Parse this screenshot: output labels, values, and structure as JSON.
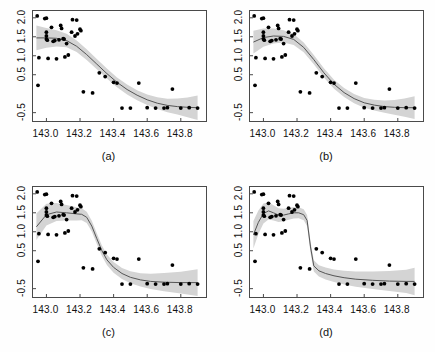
{
  "figure": {
    "type": "multi-panel-scatter-smoother",
    "panel_count": 4,
    "layout": "2x2"
  },
  "chart_data": [
    {
      "type": "scatter",
      "panel_label": "(a)",
      "title": "",
      "xlabel": "",
      "ylabel": "",
      "xlim": [
        142.92,
        143.95
      ],
      "ylim": [
        -0.72,
        2.18
      ],
      "xticks": [
        143.0,
        143.2,
        143.4,
        143.6,
        143.8
      ],
      "xticklabels": [
        "143.0",
        "143.2",
        "143.4",
        "143.6",
        "143.8"
      ],
      "yticks": [
        -0.5,
        0.5,
        1.0,
        1.5,
        2.0
      ],
      "yticklabels": [
        "-0.5",
        "0.5",
        "1.0",
        "1.5",
        "2.0"
      ],
      "grid": false,
      "legend": null,
      "point_color": "#000000",
      "line_color": "#555555",
      "band_color": "#d4d4d4",
      "smoother": "loess/spline fit with confidence band",
      "points": [
        [
          142.945,
          2.05
        ],
        [
          142.95,
          0.22
        ],
        [
          142.955,
          0.95
        ],
        [
          142.99,
          1.98
        ],
        [
          143.0,
          1.99
        ],
        [
          143.0,
          1.62
        ],
        [
          143.0,
          1.52
        ],
        [
          143.0,
          1.44
        ],
        [
          143.005,
          1.41
        ],
        [
          143.01,
          0.93
        ],
        [
          143.03,
          1.75
        ],
        [
          143.04,
          1.38
        ],
        [
          143.05,
          1.4
        ],
        [
          143.06,
          0.92
        ],
        [
          143.075,
          1.42
        ],
        [
          143.085,
          1.8
        ],
        [
          143.09,
          1.72
        ],
        [
          143.1,
          1.45
        ],
        [
          143.105,
          1.44
        ],
        [
          143.11,
          0.97
        ],
        [
          143.12,
          1.32
        ],
        [
          143.13,
          1.02
        ],
        [
          143.15,
          1.62
        ],
        [
          143.155,
          1.95
        ],
        [
          143.17,
          1.52
        ],
        [
          143.18,
          1.94
        ],
        [
          143.185,
          1.58
        ],
        [
          143.2,
          1.7
        ],
        [
          143.205,
          1.66
        ],
        [
          143.22,
          0.05
        ],
        [
          143.275,
          0.02
        ],
        [
          143.315,
          0.55
        ],
        [
          143.35,
          0.45
        ],
        [
          143.4,
          0.3
        ],
        [
          143.42,
          0.28
        ],
        [
          143.45,
          -0.38
        ],
        [
          143.5,
          -0.38
        ],
        [
          143.55,
          0.28
        ],
        [
          143.6,
          -0.37
        ],
        [
          143.65,
          -0.38
        ],
        [
          143.7,
          -0.38
        ],
        [
          143.72,
          -0.37
        ],
        [
          143.75,
          0.12
        ],
        [
          143.8,
          -0.38
        ],
        [
          143.85,
          -0.37
        ],
        [
          143.9,
          -0.38
        ]
      ],
      "fit_curve": [
        [
          142.94,
          1.47
        ],
        [
          143.0,
          1.47
        ],
        [
          143.06,
          1.46
        ],
        [
          143.12,
          1.4
        ],
        [
          143.18,
          1.25
        ],
        [
          143.24,
          1.03
        ],
        [
          143.3,
          0.78
        ],
        [
          143.36,
          0.53
        ],
        [
          143.42,
          0.3
        ],
        [
          143.48,
          0.11
        ],
        [
          143.54,
          -0.04
        ],
        [
          143.6,
          -0.16
        ],
        [
          143.66,
          -0.25
        ],
        [
          143.72,
          -0.31
        ],
        [
          143.78,
          -0.34
        ],
        [
          143.84,
          -0.36
        ],
        [
          143.9,
          -0.37
        ]
      ],
      "band_halfwidth": 0.13,
      "description": "Smoothest fit: gradual sigmoid decline across full x range"
    },
    {
      "type": "scatter",
      "panel_label": "(b)",
      "title": "",
      "xlabel": "",
      "ylabel": "",
      "xlim": [
        142.92,
        143.95
      ],
      "ylim": [
        -0.72,
        2.18
      ],
      "xticks": [
        143.0,
        143.2,
        143.4,
        143.6,
        143.8
      ],
      "xticklabels": [
        "143.0",
        "143.2",
        "143.4",
        "143.6",
        "143.8"
      ],
      "yticks": [
        -0.5,
        0.5,
        1.0,
        1.5,
        2.0
      ],
      "yticklabels": [
        "-0.5",
        "0.5",
        "1.0",
        "1.5",
        "2.0"
      ],
      "grid": false,
      "legend": null,
      "point_color": "#000000",
      "line_color": "#555555",
      "band_color": "#d4d4d4",
      "smoother": "loess/spline fit with confidence band",
      "points": [
        [
          142.945,
          2.05
        ],
        [
          142.95,
          0.22
        ],
        [
          142.955,
          0.95
        ],
        [
          142.99,
          1.98
        ],
        [
          143.0,
          1.99
        ],
        [
          143.0,
          1.62
        ],
        [
          143.0,
          1.52
        ],
        [
          143.0,
          1.44
        ],
        [
          143.005,
          1.41
        ],
        [
          143.01,
          0.93
        ],
        [
          143.03,
          1.75
        ],
        [
          143.04,
          1.38
        ],
        [
          143.05,
          1.4
        ],
        [
          143.06,
          0.92
        ],
        [
          143.075,
          1.42
        ],
        [
          143.085,
          1.8
        ],
        [
          143.09,
          1.72
        ],
        [
          143.1,
          1.45
        ],
        [
          143.105,
          1.44
        ],
        [
          143.11,
          0.97
        ],
        [
          143.12,
          1.32
        ],
        [
          143.13,
          1.02
        ],
        [
          143.15,
          1.62
        ],
        [
          143.155,
          1.95
        ],
        [
          143.17,
          1.52
        ],
        [
          143.18,
          1.94
        ],
        [
          143.185,
          1.58
        ],
        [
          143.2,
          1.7
        ],
        [
          143.205,
          1.66
        ],
        [
          143.22,
          0.05
        ],
        [
          143.275,
          0.02
        ],
        [
          143.315,
          0.55
        ],
        [
          143.35,
          0.45
        ],
        [
          143.4,
          0.3
        ],
        [
          143.42,
          0.28
        ],
        [
          143.45,
          -0.38
        ],
        [
          143.5,
          -0.38
        ],
        [
          143.55,
          0.28
        ],
        [
          143.6,
          -0.37
        ],
        [
          143.65,
          -0.38
        ],
        [
          143.7,
          -0.38
        ],
        [
          143.72,
          -0.37
        ],
        [
          143.75,
          0.12
        ],
        [
          143.8,
          -0.38
        ],
        [
          143.85,
          -0.37
        ],
        [
          143.9,
          -0.38
        ]
      ],
      "fit_curve": [
        [
          142.94,
          1.36
        ],
        [
          143.0,
          1.48
        ],
        [
          143.06,
          1.52
        ],
        [
          143.12,
          1.51
        ],
        [
          143.18,
          1.43
        ],
        [
          143.24,
          1.22
        ],
        [
          143.3,
          0.9
        ],
        [
          143.36,
          0.55
        ],
        [
          143.42,
          0.25
        ],
        [
          143.48,
          0.03
        ],
        [
          143.54,
          -0.13
        ],
        [
          143.6,
          -0.24
        ],
        [
          143.66,
          -0.3
        ],
        [
          143.72,
          -0.34
        ],
        [
          143.78,
          -0.36
        ],
        [
          143.84,
          -0.37
        ],
        [
          143.9,
          -0.37
        ]
      ],
      "band_halfwidth": 0.12,
      "description": "Moderately smooth: flatter plateau then steeper mid-range drop"
    },
    {
      "type": "scatter",
      "panel_label": "(c)",
      "title": "",
      "xlabel": "",
      "ylabel": "",
      "xlim": [
        142.92,
        143.95
      ],
      "ylim": [
        -0.72,
        2.18
      ],
      "xticks": [
        143.0,
        143.2,
        143.4,
        143.6,
        143.8
      ],
      "xticklabels": [
        "143.0",
        "143.2",
        "143.4",
        "143.6",
        "143.8"
      ],
      "yticks": [
        -0.5,
        0.5,
        1.0,
        1.5,
        2.0
      ],
      "yticklabels": [
        "-0.5",
        "0.5",
        "1.0",
        "1.5",
        "2.0"
      ],
      "grid": false,
      "legend": null,
      "point_color": "#000000",
      "line_color": "#555555",
      "band_color": "#d4d4d4",
      "smoother": "loess/spline fit with confidence band",
      "points": [
        [
          142.945,
          2.05
        ],
        [
          142.95,
          0.22
        ],
        [
          142.955,
          0.95
        ],
        [
          142.99,
          1.98
        ],
        [
          143.0,
          1.99
        ],
        [
          143.0,
          1.62
        ],
        [
          143.0,
          1.52
        ],
        [
          143.0,
          1.44
        ],
        [
          143.005,
          1.41
        ],
        [
          143.01,
          0.93
        ],
        [
          143.03,
          1.75
        ],
        [
          143.04,
          1.38
        ],
        [
          143.05,
          1.4
        ],
        [
          143.06,
          0.92
        ],
        [
          143.075,
          1.42
        ],
        [
          143.085,
          1.8
        ],
        [
          143.09,
          1.72
        ],
        [
          143.1,
          1.45
        ],
        [
          143.105,
          1.44
        ],
        [
          143.11,
          0.97
        ],
        [
          143.12,
          1.32
        ],
        [
          143.13,
          1.02
        ],
        [
          143.15,
          1.62
        ],
        [
          143.155,
          1.95
        ],
        [
          143.17,
          1.52
        ],
        [
          143.18,
          1.94
        ],
        [
          143.185,
          1.58
        ],
        [
          143.2,
          1.7
        ],
        [
          143.205,
          1.66
        ],
        [
          143.22,
          0.05
        ],
        [
          143.275,
          0.02
        ],
        [
          143.315,
          0.55
        ],
        [
          143.35,
          0.45
        ],
        [
          143.4,
          0.3
        ],
        [
          143.42,
          0.28
        ],
        [
          143.45,
          -0.38
        ],
        [
          143.5,
          -0.38
        ],
        [
          143.55,
          0.28
        ],
        [
          143.6,
          -0.37
        ],
        [
          143.65,
          -0.38
        ],
        [
          143.7,
          -0.38
        ],
        [
          143.72,
          -0.37
        ],
        [
          143.75,
          0.12
        ],
        [
          143.8,
          -0.38
        ],
        [
          143.85,
          -0.37
        ],
        [
          143.9,
          -0.38
        ]
      ],
      "fit_curve": [
        [
          142.94,
          1.13
        ],
        [
          143.0,
          1.45
        ],
        [
          143.06,
          1.52
        ],
        [
          143.12,
          1.5
        ],
        [
          143.18,
          1.47
        ],
        [
          143.21,
          1.46
        ],
        [
          143.24,
          1.38
        ],
        [
          143.27,
          1.15
        ],
        [
          143.3,
          0.82
        ],
        [
          143.33,
          0.5
        ],
        [
          143.36,
          0.26
        ],
        [
          143.4,
          0.06
        ],
        [
          143.45,
          -0.1
        ],
        [
          143.5,
          -0.2
        ],
        [
          143.56,
          -0.27
        ],
        [
          143.62,
          -0.31
        ],
        [
          143.7,
          -0.33
        ],
        [
          143.8,
          -0.34
        ],
        [
          143.9,
          -0.34
        ]
      ],
      "band_halfwidth": 0.14,
      "description": "Less smooth: long flat plateau then sharp drop near 143.30"
    },
    {
      "type": "scatter",
      "panel_label": "(d)",
      "title": "",
      "xlabel": "",
      "ylabel": "",
      "xlim": [
        142.92,
        143.95
      ],
      "ylim": [
        -0.72,
        2.18
      ],
      "xticks": [
        143.0,
        143.2,
        143.4,
        143.6,
        143.8
      ],
      "xticklabels": [
        "143.0",
        "143.2",
        "143.4",
        "143.6",
        "143.8"
      ],
      "yticks": [
        -0.5,
        0.5,
        1.0,
        1.5,
        2.0
      ],
      "yticklabels": [
        "-0.5",
        "0.5",
        "1.0",
        "1.5",
        "2.0"
      ],
      "grid": false,
      "legend": null,
      "point_color": "#000000",
      "line_color": "#555555",
      "band_color": "#d4d4d4",
      "smoother": "loess/spline fit with confidence band",
      "points": [
        [
          142.945,
          2.05
        ],
        [
          142.95,
          0.22
        ],
        [
          142.955,
          0.95
        ],
        [
          142.99,
          1.98
        ],
        [
          143.0,
          1.99
        ],
        [
          143.0,
          1.62
        ],
        [
          143.0,
          1.52
        ],
        [
          143.0,
          1.44
        ],
        [
          143.005,
          1.41
        ],
        [
          143.01,
          0.93
        ],
        [
          143.03,
          1.75
        ],
        [
          143.04,
          1.38
        ],
        [
          143.05,
          1.4
        ],
        [
          143.06,
          0.92
        ],
        [
          143.075,
          1.42
        ],
        [
          143.085,
          1.8
        ],
        [
          143.09,
          1.72
        ],
        [
          143.1,
          1.45
        ],
        [
          143.105,
          1.44
        ],
        [
          143.11,
          0.97
        ],
        [
          143.12,
          1.32
        ],
        [
          143.13,
          1.02
        ],
        [
          143.15,
          1.62
        ],
        [
          143.155,
          1.95
        ],
        [
          143.17,
          1.52
        ],
        [
          143.18,
          1.94
        ],
        [
          143.185,
          1.58
        ],
        [
          143.2,
          1.7
        ],
        [
          143.205,
          1.66
        ],
        [
          143.22,
          0.05
        ],
        [
          143.275,
          0.02
        ],
        [
          143.315,
          0.55
        ],
        [
          143.35,
          0.45
        ],
        [
          143.4,
          0.3
        ],
        [
          143.42,
          0.28
        ],
        [
          143.45,
          -0.38
        ],
        [
          143.5,
          -0.38
        ],
        [
          143.55,
          0.28
        ],
        [
          143.6,
          -0.37
        ],
        [
          143.65,
          -0.38
        ],
        [
          143.7,
          -0.38
        ],
        [
          143.72,
          -0.37
        ],
        [
          143.75,
          0.12
        ],
        [
          143.8,
          -0.38
        ],
        [
          143.85,
          -0.37
        ],
        [
          143.9,
          -0.38
        ]
      ],
      "fit_curve": [
        [
          142.94,
          0.92
        ],
        [
          142.97,
          1.25
        ],
        [
          143.0,
          1.48
        ],
        [
          143.03,
          1.55
        ],
        [
          143.06,
          1.5
        ],
        [
          143.09,
          1.44
        ],
        [
          143.12,
          1.44
        ],
        [
          143.15,
          1.47
        ],
        [
          143.18,
          1.5
        ],
        [
          143.21,
          1.5
        ],
        [
          143.24,
          1.45
        ],
        [
          143.26,
          1.3
        ],
        [
          143.28,
          0.6
        ],
        [
          143.3,
          0.1
        ],
        [
          143.33,
          -0.03
        ],
        [
          143.37,
          -0.1
        ],
        [
          143.42,
          -0.16
        ],
        [
          143.48,
          -0.21
        ],
        [
          143.55,
          -0.25
        ],
        [
          143.65,
          -0.28
        ],
        [
          143.75,
          -0.3
        ],
        [
          143.85,
          -0.31
        ],
        [
          143.9,
          -0.31
        ]
      ],
      "band_halfwidth": 0.145,
      "description": "Least smooth: wiggly plateau with near-vertical drop at 143.28"
    }
  ]
}
